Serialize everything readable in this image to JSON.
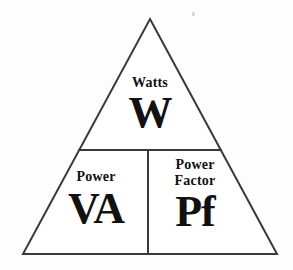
{
  "diagram": {
    "type": "power-triangle",
    "stroke_color": "#3a3a3a",
    "text_color": "#111111",
    "background_color": "#fdfdfd",
    "geometry": {
      "apex": [
        150,
        19
      ],
      "base_left": [
        23,
        254
      ],
      "base_right": [
        277,
        254
      ],
      "horizontal_divider": {
        "y": 150,
        "x_start": 78,
        "x_end": 222
      },
      "vertical_divider": {
        "x": 148,
        "y_start": 150,
        "y_end": 254
      }
    },
    "cells": [
      {
        "id": "watts",
        "position": "top",
        "label": "Watts",
        "symbol": "W"
      },
      {
        "id": "volt-amperes",
        "position": "bottom-left",
        "label": "Power",
        "symbol": "VA"
      },
      {
        "id": "power-factor",
        "position": "bottom-right",
        "label_line1": "Power",
        "label_line2": "Factor",
        "symbol": "Pf"
      }
    ]
  }
}
